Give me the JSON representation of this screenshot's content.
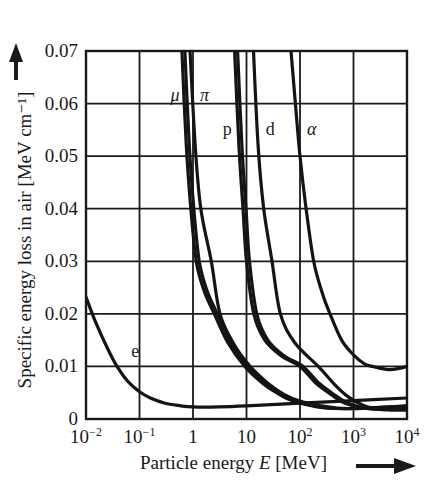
{
  "chart_data": {
    "type": "line",
    "title": "",
    "xlabel": "Particle energy E [MeV]",
    "xlabel_parts": {
      "prefix": "Particle energy ",
      "symbol": "E",
      "suffix": " [MeV]"
    },
    "ylabel": "Specific energy loss in air [MeV cm⁻¹]",
    "xscale": "log",
    "xlim": [
      0.01,
      10000
    ],
    "ylim": [
      0,
      0.07
    ],
    "grid": true,
    "legend": "inline curve labels",
    "x_tick_labels": [
      {
        "value": 0.01,
        "base": "10",
        "exp": "−2"
      },
      {
        "value": 0.1,
        "base": "10",
        "exp": "−1"
      },
      {
        "value": 1,
        "base": "1",
        "exp": ""
      },
      {
        "value": 10,
        "base": "10",
        "exp": ""
      },
      {
        "value": 100,
        "base": "10",
        "exp": "2"
      },
      {
        "value": 1000,
        "base": "10",
        "exp": "3"
      },
      {
        "value": 10000,
        "base": "10",
        "exp": "4"
      }
    ],
    "y_tick_labels": [
      "0",
      "0.01",
      "0.02",
      "0.03",
      "0.04",
      "0.05",
      "0.06",
      "0.07"
    ],
    "y_ticks": [
      0,
      0.01,
      0.02,
      0.03,
      0.04,
      0.05,
      0.06,
      0.07
    ],
    "series": [
      {
        "name": "e",
        "label": "e",
        "label_pos": {
          "E": 0.07,
          "y": 0.0117
        },
        "points": [
          [
            0.01,
            0.0232
          ],
          [
            0.015,
            0.0185
          ],
          [
            0.025,
            0.0135
          ],
          [
            0.038,
            0.01
          ],
          [
            0.06,
            0.0072
          ],
          [
            0.1,
            0.0052
          ],
          [
            0.16,
            0.004
          ],
          [
            0.3,
            0.003
          ],
          [
            0.6,
            0.0025
          ],
          [
            1,
            0.0023
          ],
          [
            3,
            0.0023
          ],
          [
            10,
            0.0025
          ],
          [
            100,
            0.003
          ],
          [
            1000,
            0.0035
          ],
          [
            10000,
            0.004
          ]
        ]
      },
      {
        "name": "mu",
        "label": "μ",
        "label_pos": {
          "E": 0.38,
          "y": 0.0605
        },
        "points": [
          [
            0.62,
            0.07
          ],
          [
            0.75,
            0.052
          ],
          [
            0.91,
            0.04
          ],
          [
            1.15,
            0.03
          ],
          [
            1.6,
            0.0245
          ],
          [
            2.5,
            0.02
          ],
          [
            4.5,
            0.0145
          ],
          [
            9.3,
            0.01
          ],
          [
            20,
            0.0068
          ],
          [
            34,
            0.0052
          ],
          [
            60,
            0.0038
          ],
          [
            120,
            0.0028
          ],
          [
            300,
            0.0021
          ],
          [
            1000,
            0.002
          ],
          [
            3000,
            0.0022
          ],
          [
            10000,
            0.0025
          ]
        ]
      },
      {
        "name": "pi",
        "label": "π",
        "label_pos": {
          "E": 1.35,
          "y": 0.0605
        },
        "points": [
          [
            0.88,
            0.07
          ],
          [
            1.1,
            0.052
          ],
          [
            1.4,
            0.04
          ],
          [
            2.2,
            0.03
          ],
          [
            3.2,
            0.02
          ],
          [
            6,
            0.014
          ],
          [
            11.7,
            0.01
          ],
          [
            25,
            0.0068
          ],
          [
            50,
            0.0047
          ],
          [
            100,
            0.0034
          ],
          [
            250,
            0.0025
          ],
          [
            500,
            0.0021
          ],
          [
            1500,
            0.002
          ],
          [
            5000,
            0.0022
          ],
          [
            10000,
            0.0024
          ]
        ]
      },
      {
        "name": "p",
        "label": "p",
        "label_pos": {
          "E": 3.6,
          "y": 0.054
        },
        "points": [
          [
            6.0,
            0.07
          ],
          [
            7.2,
            0.052
          ],
          [
            8.6,
            0.04
          ],
          [
            10,
            0.03
          ],
          [
            13.7,
            0.02
          ],
          [
            22,
            0.015
          ],
          [
            45,
            0.012
          ],
          [
            100,
            0.01
          ],
          [
            200,
            0.0068
          ],
          [
            400,
            0.0045
          ],
          [
            700,
            0.003
          ],
          [
            1500,
            0.0021
          ],
          [
            3000,
            0.0018
          ],
          [
            6000,
            0.0019
          ],
          [
            10000,
            0.0021
          ]
        ]
      },
      {
        "name": "d",
        "label": "d",
        "label_pos": {
          "E": 23,
          "y": 0.054
        },
        "points": [
          [
            13.5,
            0.07
          ],
          [
            16.5,
            0.052
          ],
          [
            21,
            0.04
          ],
          [
            30,
            0.03
          ],
          [
            43,
            0.02
          ],
          [
            80,
            0.0145
          ],
          [
            220,
            0.01
          ],
          [
            450,
            0.0065
          ],
          [
            800,
            0.0042
          ],
          [
            1500,
            0.0026
          ],
          [
            2500,
            0.002
          ],
          [
            5000,
            0.0017
          ],
          [
            10000,
            0.0017
          ]
        ]
      },
      {
        "name": "alpha",
        "label": "α",
        "label_pos": {
          "E": 135,
          "y": 0.054
        },
        "points": [
          [
            68,
            0.07
          ],
          [
            82,
            0.06
          ],
          [
            100,
            0.05
          ],
          [
            130,
            0.04
          ],
          [
            180,
            0.03
          ],
          [
            260,
            0.024
          ],
          [
            363,
            0.02
          ],
          [
            600,
            0.015
          ],
          [
            1000,
            0.0122
          ],
          [
            1600,
            0.0105
          ],
          [
            2500,
            0.0099
          ],
          [
            4500,
            0.0094
          ],
          [
            7000,
            0.0096
          ],
          [
            10000,
            0.01
          ]
        ]
      }
    ]
  },
  "layout": {
    "plot_left": 86,
    "plot_right": 407,
    "plot_top": 51,
    "plot_bottom": 419
  }
}
